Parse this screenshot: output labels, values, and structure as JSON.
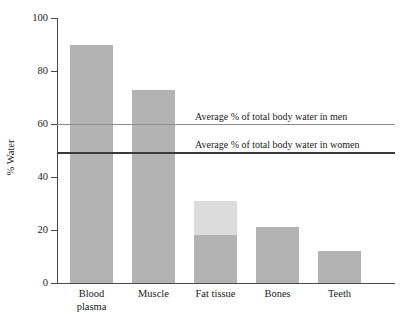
{
  "chart_data": {
    "type": "bar",
    "title": "",
    "xlabel": "",
    "ylabel": "% Water",
    "ylim": [
      0,
      100
    ],
    "yticks": [
      0,
      20,
      40,
      60,
      80,
      100
    ],
    "grid": false,
    "legend": "none",
    "categories": [
      "Blood plasma",
      "Muscle",
      "Fat tissue",
      "Bones",
      "Teeth"
    ],
    "values": [
      90,
      73,
      31,
      21,
      12
    ],
    "series": [
      {
        "name": "% Water",
        "values": [
          90,
          73,
          31,
          21,
          12
        ]
      }
    ],
    "bars": [
      {
        "category": "Blood plasma",
        "category_line1": "Blood",
        "category_line2": "plasma",
        "value": 90,
        "segments": [
          {
            "name": "water",
            "from": 0,
            "to": 90,
            "color": "#b3b3b3"
          }
        ]
      },
      {
        "category": "Muscle",
        "category_line1": "Muscle",
        "category_line2": "",
        "value": 73,
        "segments": [
          {
            "name": "water",
            "from": 0,
            "to": 73,
            "color": "#b3b3b3"
          }
        ]
      },
      {
        "category": "Fat tissue",
        "category_line1": "Fat tissue",
        "category_line2": "",
        "value": 31,
        "segments": [
          {
            "name": "water-lower-range",
            "from": 0,
            "to": 18,
            "color": "#b3b3b3"
          },
          {
            "name": "water-upper-range",
            "from": 18,
            "to": 31,
            "color": "#dcdcdc"
          }
        ]
      },
      {
        "category": "Bones",
        "category_line1": "Bones",
        "category_line2": "",
        "value": 21,
        "segments": [
          {
            "name": "water",
            "from": 0,
            "to": 21,
            "color": "#b3b3b3"
          }
        ]
      },
      {
        "category": "Teeth",
        "category_line1": "Teeth",
        "category_line2": "",
        "value": 12,
        "segments": [
          {
            "name": "water",
            "from": 0,
            "to": 12,
            "color": "#b3b3b3"
          }
        ]
      }
    ],
    "reference_lines": [
      {
        "id": "men",
        "label": "Average % of total body water in men",
        "value": 60,
        "style": "thin",
        "color": "#8d8d8d"
      },
      {
        "id": "women",
        "label": "Average % of total body water in women",
        "value": 49.5,
        "style": "thick",
        "color": "#3a3a3a"
      }
    ],
    "annotations": [
      "Average % of total body water in men",
      "Average % of total body water in women"
    ],
    "colors": {
      "bar_fill": "#b3b3b3",
      "bar_fill_light": "#dcdcdc",
      "axis": "#4a4a4a",
      "men_line": "#8d8d8d",
      "women_line": "#3a3a3a",
      "background": "#ffffff",
      "text": "#1a1a1a"
    }
  },
  "yticks": {
    "t0": "0",
    "t1": "20",
    "t2": "40",
    "t3": "60",
    "t4": "80",
    "t5": "100"
  }
}
